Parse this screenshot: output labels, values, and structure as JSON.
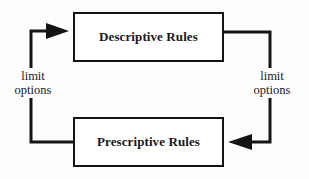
{
  "diagram": {
    "type": "cycle-flow-diagram",
    "background_color": "#fdfdfd",
    "line_color": "#141414",
    "text_color": "#19191c",
    "nodes": [
      {
        "id": "descriptive",
        "label": "Descriptive Rules",
        "position": "top"
      },
      {
        "id": "prescriptive",
        "label": "Prescriptive Rules",
        "position": "bottom"
      }
    ],
    "edges": [
      {
        "id": "descriptive-to-prescriptive",
        "from": "descriptive",
        "to": "prescriptive",
        "side": "right",
        "direction": "clockwise",
        "label_line1": "limit",
        "label_line2": "options",
        "arrow": "left-pointing"
      },
      {
        "id": "prescriptive-to-descriptive",
        "from": "prescriptive",
        "to": "descriptive",
        "side": "left",
        "direction": "clockwise",
        "label_line1": "limit",
        "label_line2": "options",
        "arrow": "right-pointing"
      }
    ]
  }
}
